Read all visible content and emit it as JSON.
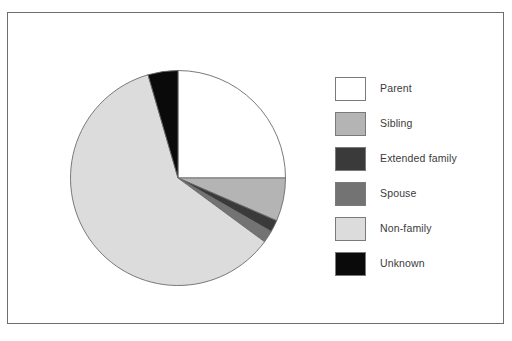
{
  "figure": {
    "background_color": "#ffffff",
    "frame_border_color": "#6e6e6e",
    "title": ""
  },
  "chart_data": {
    "type": "pie",
    "title": "",
    "legend_position": "right",
    "start_angle_deg": 90,
    "direction": "counterclockwise",
    "categories": [
      "Parent",
      "Sibling",
      "Extended family",
      "Spouse",
      "Non-family",
      "Unknown"
    ],
    "values": [
      25.0,
      6.5,
      1.8,
      1.8,
      60.4,
      4.5
    ],
    "colors": [
      "#ffffff",
      "#b4b4b4",
      "#3a3a3a",
      "#737373",
      "#dcdcdc",
      "#0a0a0a"
    ],
    "slice_edge_color": "#6b6b6b",
    "units": "percent"
  },
  "legend": {
    "items": [
      {
        "label": "Parent",
        "color": "#ffffff"
      },
      {
        "label": "Sibling",
        "color": "#b4b4b4"
      },
      {
        "label": "Extended family",
        "color": "#3a3a3a"
      },
      {
        "label": "Spouse",
        "color": "#737373"
      },
      {
        "label": "Non-family",
        "color": "#dcdcdc"
      },
      {
        "label": "Unknown",
        "color": "#0a0a0a"
      }
    ]
  }
}
